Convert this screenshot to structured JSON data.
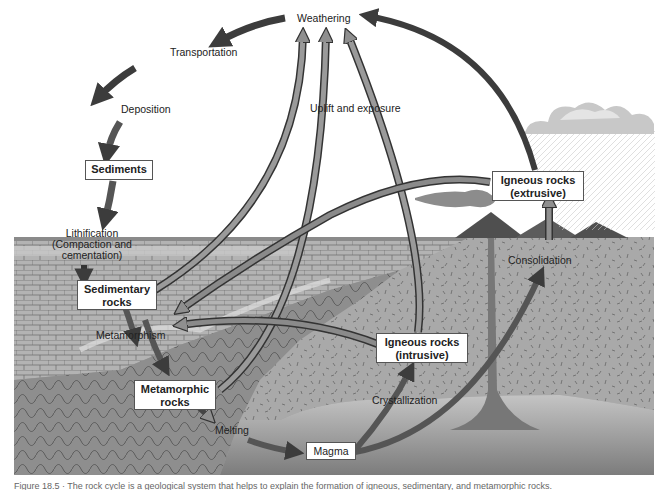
{
  "diagram": {
    "title": "The rock cycle",
    "nodes": {
      "weathering": "Weathering",
      "transportation": "Transportation",
      "deposition": "Deposition",
      "sediments": "Sediments",
      "lithification_1": "Lithification",
      "lithification_2": "(Compaction and",
      "lithification_3": "cementation)",
      "sedimentary_1": "Sedimentary",
      "sedimentary_2": "rocks",
      "metamorphism": "Metamorphism",
      "metamorphic_1": "Metamorphic",
      "metamorphic_2": "rocks",
      "melting": "Melting",
      "magma": "Magma",
      "crystallization": "Crystallization",
      "igneous_intrusive_1": "Igneous rocks",
      "igneous_intrusive_2": "(intrusive)",
      "igneous_extrusive_1": "Igneous rocks",
      "igneous_extrusive_2": "(extrusive)",
      "consolidation": "Consolidation",
      "uplift": "Uplift and exposure"
    },
    "edges": [
      {
        "from": "Weathering",
        "to": "Transportation"
      },
      {
        "from": "Transportation",
        "to": "Deposition"
      },
      {
        "from": "Deposition",
        "to": "Sediments"
      },
      {
        "from": "Sediments",
        "to": "Lithification"
      },
      {
        "from": "Lithification",
        "to": "Sedimentary rocks"
      },
      {
        "from": "Sedimentary rocks",
        "to": "Metamorphism"
      },
      {
        "from": "Metamorphism",
        "to": "Metamorphic rocks"
      },
      {
        "from": "Metamorphic rocks",
        "to": "Melting"
      },
      {
        "from": "Melting",
        "to": "Magma"
      },
      {
        "from": "Magma",
        "to": "Crystallization"
      },
      {
        "from": "Crystallization",
        "to": "Igneous rocks (intrusive)"
      },
      {
        "from": "Magma",
        "to": "Consolidation"
      },
      {
        "from": "Consolidation",
        "to": "Igneous rocks (extrusive)"
      },
      {
        "from": "Igneous rocks (extrusive)",
        "to": "Weathering"
      },
      {
        "from": "Igneous rocks (intrusive)",
        "to": "Metamorphism"
      },
      {
        "from": "Igneous rocks (extrusive)",
        "to": "Metamorphism"
      },
      {
        "from": "Sedimentary rocks",
        "to": "Weathering",
        "label": "Uplift and exposure"
      },
      {
        "from": "Metamorphic rocks",
        "to": "Weathering",
        "label": "Uplift and exposure"
      },
      {
        "from": "Igneous rocks (intrusive)",
        "to": "Weathering",
        "label": "Uplift and exposure"
      }
    ]
  },
  "caption": "Figure 18.5 · The rock cycle is a geological system that helps to explain the formation of igneous, sedimentary, and metamorphic rocks."
}
